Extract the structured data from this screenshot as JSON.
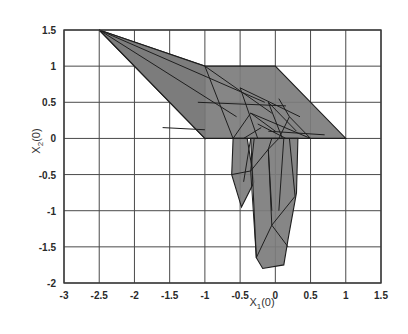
{
  "chart_data": {
    "type": "polygon-mesh",
    "title": "",
    "xlabel": "X1(0)",
    "ylabel": "X2(0)",
    "xlabel_main": "X",
    "xlabel_sub": "1",
    "xlabel_tail": "(0)",
    "ylabel_main": "X",
    "ylabel_sub": "2",
    "ylabel_tail": "(0)",
    "xlim": [
      -3,
      1.5
    ],
    "ylim": [
      -2,
      1.5
    ],
    "grid": true,
    "xticks": [
      -3,
      -2.5,
      -2,
      -1.5,
      -1,
      -0.5,
      0,
      0.5,
      1,
      1.5
    ],
    "xtick_labels": [
      "-3",
      "-2.5",
      "-2",
      "-1.5",
      "-1",
      "-0.5",
      "0",
      "0.5",
      "1",
      "1.5"
    ],
    "yticks": [
      1.5,
      1,
      0.5,
      0,
      -0.5,
      -1,
      -1.5,
      -2
    ],
    "ytick_labels": [
      "1.5",
      "1",
      "0.5",
      "0",
      "-0.5",
      "-1",
      "-1.5",
      "-2"
    ],
    "fill_color": "#7c7c7c",
    "edge_color": "#1e1e1e",
    "grid_color": "#4a4a4a",
    "polygons": [
      {
        "name": "upper-left-triangle",
        "points": [
          [
            -2.5,
            1.5
          ],
          [
            -1,
            1
          ],
          [
            -1,
            0
          ]
        ]
      },
      {
        "name": "upper-band",
        "points": [
          [
            -2.5,
            1.5
          ],
          [
            -1,
            1
          ],
          [
            0,
            1
          ],
          [
            1,
            0
          ],
          [
            -1,
            0
          ]
        ]
      },
      {
        "name": "left-lobe",
        "points": [
          [
            -0.6,
            0
          ],
          [
            -0.4,
            0
          ],
          [
            -0.3,
            -0.6
          ],
          [
            -0.48,
            -0.95
          ],
          [
            -0.62,
            -0.5
          ]
        ]
      },
      {
        "name": "lower-column",
        "points": [
          [
            -0.35,
            0
          ],
          [
            0.32,
            0
          ],
          [
            0.3,
            -0.75
          ],
          [
            0.18,
            -1.4
          ],
          [
            0.12,
            -1.75
          ],
          [
            -0.18,
            -1.8
          ],
          [
            -0.27,
            -1.65
          ]
        ]
      }
    ],
    "mesh_lines": [
      [
        [
          -2.5,
          1.5
        ],
        [
          -0.15,
          0.5
        ]
      ],
      [
        [
          -2.5,
          1.5
        ],
        [
          -0.55,
          0.3
        ]
      ],
      [
        [
          -1.1,
          0.5
        ],
        [
          0.15,
          0.45
        ]
      ],
      [
        [
          -1,
          1
        ],
        [
          -0.6,
          0
        ]
      ],
      [
        [
          -1,
          1
        ],
        [
          -0.05,
          0.35
        ]
      ],
      [
        [
          -0.5,
          0.7
        ],
        [
          0.35,
          0.3
        ]
      ],
      [
        [
          -0.5,
          0.7
        ],
        [
          -0.25,
          0
        ]
      ],
      [
        [
          -0.35,
          0.35
        ],
        [
          0.5,
          0.0
        ]
      ],
      [
        [
          -0.35,
          0.35
        ],
        [
          -0.6,
          0
        ]
      ],
      [
        [
          -0.35,
          0.35
        ],
        [
          0,
          0.1
        ]
      ],
      [
        [
          -0.1,
          0.5
        ],
        [
          0.1,
          0
        ]
      ],
      [
        [
          -0.1,
          0.5
        ],
        [
          0.3,
          0.1
        ]
      ],
      [
        [
          0.05,
          0.55
        ],
        [
          0.2,
          0.3
        ]
      ],
      [
        [
          0.2,
          0.3
        ],
        [
          0.5,
          0
        ]
      ],
      [
        [
          0.2,
          0.3
        ],
        [
          0.05,
          0
        ]
      ],
      [
        [
          -0.25,
          0.2
        ],
        [
          0.15,
          0
        ]
      ],
      [
        [
          -0.2,
          0.15
        ],
        [
          -0.45,
          0
        ]
      ],
      [
        [
          -0.1,
          0.1
        ],
        [
          0.7,
          0.05
        ]
      ],
      [
        [
          -1.6,
          0.15
        ],
        [
          -1.0,
          0.12
        ]
      ],
      [
        [
          -0.35,
          0
        ],
        [
          -0.45,
          -0.6
        ]
      ],
      [
        [
          -0.62,
          -0.5
        ],
        [
          -0.35,
          -0.45
        ]
      ],
      [
        [
          -0.35,
          -0.45
        ],
        [
          -0.3,
          0
        ]
      ],
      [
        [
          -0.35,
          -0.45
        ],
        [
          -0.1,
          -0.15
        ]
      ],
      [
        [
          -0.1,
          -0.15
        ],
        [
          -0.05,
          0
        ]
      ],
      [
        [
          -0.1,
          -0.15
        ],
        [
          0.05,
          0
        ]
      ],
      [
        [
          -0.1,
          -0.15
        ],
        [
          -0.05,
          -1.0
        ]
      ],
      [
        [
          -0.35,
          -0.45
        ],
        [
          -0.27,
          -1.65
        ]
      ],
      [
        [
          0.12,
          0
        ],
        [
          0.05,
          -1.0
        ]
      ],
      [
        [
          0.2,
          0
        ],
        [
          0.28,
          -0.8
        ]
      ],
      [
        [
          0.28,
          -0.8
        ],
        [
          -0.05,
          -1.2
        ]
      ],
      [
        [
          -0.05,
          -1.2
        ],
        [
          -0.27,
          -1.65
        ]
      ],
      [
        [
          -0.05,
          -1.2
        ],
        [
          0.18,
          -1.5
        ]
      ],
      [
        [
          -0.05,
          -1.2
        ],
        [
          -0.1,
          -0.15
        ]
      ]
    ]
  }
}
